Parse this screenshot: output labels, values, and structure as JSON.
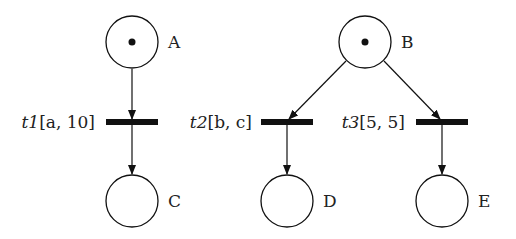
{
  "diagram": {
    "type": "petri-net",
    "places": [
      {
        "id": "A",
        "label": "A",
        "tokens": 1,
        "cx": 132,
        "cy": 42
      },
      {
        "id": "B",
        "label": "B",
        "tokens": 1,
        "cx": 365,
        "cy": 42
      },
      {
        "id": "C",
        "label": "C",
        "tokens": 0,
        "cx": 132,
        "cy": 201
      },
      {
        "id": "D",
        "label": "D",
        "tokens": 0,
        "cx": 287,
        "cy": 201
      },
      {
        "id": "E",
        "label": "E",
        "tokens": 0,
        "cx": 442,
        "cy": 201
      }
    ],
    "transitions": [
      {
        "id": "t1",
        "name": "t1",
        "interval": "[a, 10]",
        "label": "t1[a, 10]",
        "x": 132,
        "y": 122
      },
      {
        "id": "t2",
        "name": "t2",
        "interval": "[b, c]",
        "label": "t2[b, c]",
        "x": 287,
        "y": 122
      },
      {
        "id": "t3",
        "name": "t3",
        "interval": "[5, 5]",
        "label": "t3[5, 5]",
        "x": 442,
        "y": 122
      }
    ],
    "arcs": [
      {
        "from": "A",
        "to": "t1"
      },
      {
        "from": "t1",
        "to": "C"
      },
      {
        "from": "B",
        "to": "t2"
      },
      {
        "from": "B",
        "to": "t3"
      },
      {
        "from": "t2",
        "to": "D"
      },
      {
        "from": "t3",
        "to": "E"
      }
    ]
  },
  "labels": {
    "A": "A",
    "B": "B",
    "C": "C",
    "D": "D",
    "E": "E",
    "t1_name": "t1",
    "t1_interval": "[a, 10]",
    "t2_name": "t2",
    "t2_interval": "[b, c]",
    "t3_name": "t3",
    "t3_interval": "[5, 5]"
  }
}
